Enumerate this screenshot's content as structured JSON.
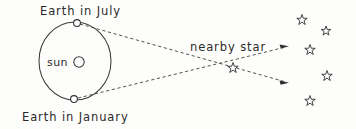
{
  "figure": {
    "kind": "stellar-parallax-diagram",
    "background_color": "#fdfdfb",
    "ink_color": "#3a3a3a",
    "width": 356,
    "height": 129
  },
  "labels": {
    "earth_july": "Earth in July",
    "earth_january": "Earth in January",
    "sun": "sun",
    "nearby_star": "nearby star"
  },
  "orbit": {
    "center_x": 75,
    "center_y": 61,
    "radius_x": 36,
    "radius_y": 39
  },
  "sun": {
    "symbol_cx": 79,
    "symbol_cy": 62,
    "symbol_r": 5.2,
    "text_x": 47,
    "text_y": 66
  },
  "earth_positions": [
    {
      "name": "earth-july",
      "cx": 77,
      "cy": 23,
      "r": 3.4
    },
    {
      "name": "earth-january",
      "cx": 74,
      "cy": 99,
      "r": 3.4
    }
  ],
  "nearby_star": {
    "cx": 233,
    "cy": 68,
    "size": 11,
    "label_x": 190,
    "label_y": 51
  },
  "sight_lines": [
    {
      "name": "july-sightline",
      "from_x": 80,
      "from_y": 24,
      "to_x": 286,
      "to_y": 82,
      "arrow_angle_deg": 15.7
    },
    {
      "name": "january-sightline",
      "from_x": 78,
      "from_y": 98,
      "to_x": 286,
      "to_y": 47,
      "arrow_angle_deg": -13.8
    }
  ],
  "background_stars": [
    {
      "name": "background-star-1",
      "cx": 302,
      "cy": 20,
      "size": 11
    },
    {
      "name": "background-star-2",
      "cx": 326,
      "cy": 31,
      "size": 10
    },
    {
      "name": "background-star-3",
      "cx": 310,
      "cy": 50,
      "size": 11
    },
    {
      "name": "background-star-4",
      "cx": 327,
      "cy": 76,
      "size": 11
    },
    {
      "name": "background-star-5",
      "cx": 310,
      "cy": 101,
      "size": 11
    }
  ]
}
